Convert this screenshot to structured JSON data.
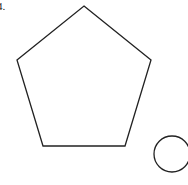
{
  "problem": {
    "number_label": "4."
  },
  "shapes": {
    "pentagon": {
      "points": "84,6 151,60 125,146 43,146 17,60",
      "stroke": "#222222",
      "stroke_width": 1.3
    },
    "circle": {
      "cx": 172,
      "cy": 154,
      "r": 18,
      "stroke": "#222222",
      "stroke_width": 1.3
    }
  }
}
